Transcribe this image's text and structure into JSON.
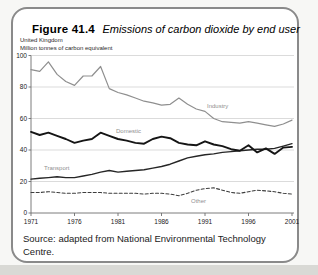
{
  "figure": {
    "label": "Figure 41.4",
    "title": "Emissions of carbon dioxide by end user"
  },
  "chart": {
    "region": "United Kingdom",
    "units": "Million tonnes of carbon equivalent"
  },
  "source": "Source: adapted from National Environmental Technology Centre.",
  "chart_data": {
    "type": "line",
    "title": "Emissions of carbon dioxide by end user",
    "subtitle": [
      "United Kingdom",
      "Million tonnes of carbon equivalent"
    ],
    "x": [
      1971,
      1972,
      1973,
      1974,
      1975,
      1976,
      1977,
      1978,
      1979,
      1980,
      1981,
      1982,
      1983,
      1984,
      1985,
      1986,
      1987,
      1988,
      1989,
      1990,
      1991,
      1992,
      1993,
      1994,
      1995,
      1996,
      1997,
      1998,
      1999,
      2000,
      2001
    ],
    "x_ticks": [
      1971,
      1976,
      1981,
      1986,
      1991,
      1996,
      2001
    ],
    "y_ticks": [
      0,
      20,
      40,
      60,
      80,
      100
    ],
    "ylim": [
      0,
      100
    ],
    "grid": "horizontal",
    "legend_position": "inline-labels",
    "series": [
      {
        "name": "Industry",
        "color": "#8f8f8f",
        "style": "solid",
        "values": [
          91,
          90,
          96,
          88,
          83.5,
          81,
          87,
          87,
          93,
          79,
          76.5,
          75,
          73,
          71,
          70,
          68.5,
          69,
          73,
          69,
          66,
          64.5,
          60,
          58,
          57.5,
          57,
          58,
          57,
          56,
          55,
          56.5,
          59
        ]
      },
      {
        "name": "Domestic",
        "color": "#151515",
        "style": "solid-bold",
        "values": [
          51.5,
          49.5,
          51,
          49,
          47,
          44.5,
          46,
          47,
          51,
          49,
          47,
          46,
          44.5,
          44,
          47,
          48.5,
          47.5,
          44.5,
          43.5,
          43,
          45.5,
          43.5,
          42.5,
          40.5,
          39.5,
          43,
          38.5,
          41,
          37.5,
          41.5,
          42
        ]
      },
      {
        "name": "Transport",
        "color": "#262626",
        "style": "solid",
        "values": [
          21.5,
          22,
          22.5,
          23,
          22.5,
          22.5,
          23.5,
          24.5,
          26,
          27,
          26,
          26.5,
          27,
          27.5,
          28.5,
          29.5,
          31,
          33,
          35,
          36,
          37,
          37.5,
          38.5,
          39,
          39.5,
          40,
          40.5,
          40.5,
          41,
          42.5,
          44
        ]
      },
      {
        "name": "Other",
        "color": "#3d3d3d",
        "style": "dashed",
        "values": [
          13,
          13,
          13.5,
          13,
          12.5,
          12.5,
          13,
          13,
          13,
          12.5,
          12.5,
          12.5,
          12.5,
          12,
          12.5,
          12.5,
          12,
          11,
          12.5,
          14.5,
          15.5,
          16,
          14.5,
          13,
          12.5,
          13.5,
          14.5,
          14,
          13.5,
          12.5,
          12
        ]
      }
    ]
  }
}
